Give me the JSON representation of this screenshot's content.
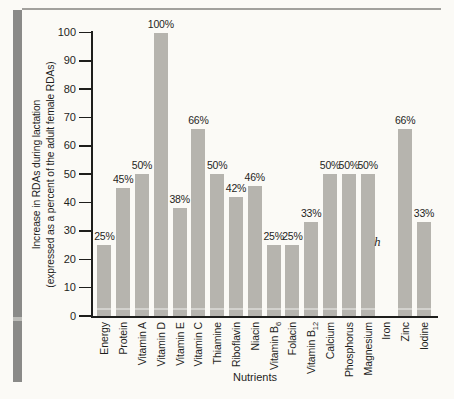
{
  "colors": {
    "background": "#fbfaf6",
    "binding_stripe": "#8a8a88",
    "stripe_gap": "#bcbcb8",
    "top_rule": "#a2a19d",
    "bar": "#b6b4ae",
    "axis": "#1e1e1c",
    "text": "#1f1f1d"
  },
  "chart_data": {
    "type": "bar",
    "title": "",
    "xlabel": "Nutrients",
    "ylabel": "Increase in RDAs during lactation (expressed as a percent of the adult female RDAs)",
    "ylabel_lines": [
      "Increase in RDAs during lactation",
      "(expressed as a percent of the adult female RDAs)"
    ],
    "ylim": [
      0,
      100
    ],
    "yticks": [
      0,
      10,
      20,
      30,
      40,
      50,
      60,
      70,
      80,
      90,
      100
    ],
    "grid": false,
    "legend": false,
    "categories": [
      {
        "label": "Energy"
      },
      {
        "label": "Protein"
      },
      {
        "label": "Vitamin A"
      },
      {
        "label": "Vitamin D"
      },
      {
        "label": "Vitamin E"
      },
      {
        "label": "Vitamin C"
      },
      {
        "label": "Thiamine"
      },
      {
        "label": "Riboflavin"
      },
      {
        "label": "Niacin"
      },
      {
        "label": "Vitamin B",
        "sub": "6"
      },
      {
        "label": "Folacin"
      },
      {
        "label": "Vitamin B",
        "sub": "12"
      },
      {
        "label": "Calcium"
      },
      {
        "label": "Phosphorus"
      },
      {
        "label": "Magnesium"
      },
      {
        "label": "Iron"
      },
      {
        "label": "Zinc"
      },
      {
        "label": "Iodine"
      }
    ],
    "values": [
      25,
      45,
      50,
      100,
      38,
      66,
      50,
      42,
      46,
      25,
      25,
      33,
      50,
      50,
      50,
      null,
      66,
      33
    ],
    "bar_labels": [
      "25%",
      "45%",
      "50%",
      "100%",
      "38%",
      "66%",
      "50%",
      "42%",
      "46%",
      "25%",
      "25%",
      "33%",
      "50%",
      "50%",
      "50%",
      null,
      "66%",
      "33%"
    ],
    "annotations": [
      {
        "category": "Iron",
        "text": "h",
        "y_percent": 26
      }
    ]
  }
}
